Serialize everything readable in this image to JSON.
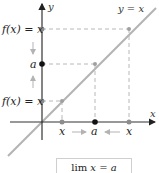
{
  "diagram": {
    "axis_labels": {
      "x": "x",
      "y": "y"
    },
    "line_label": "y = x",
    "y_labels": {
      "top": "f(x) = x",
      "middle": "a",
      "bottom": "f(x) = x"
    },
    "x_labels": {
      "left": "x",
      "middle": "a",
      "right": "x"
    },
    "formula": {
      "lim": "lim",
      "expr": "x = a"
    },
    "colors": {
      "line": "#b3b3b3",
      "axis": "#333333",
      "dash": "#b8b8b8",
      "point_gray": "#8c8c8c",
      "point_black": "#111111",
      "arrow": "#b3b3b3"
    }
  }
}
